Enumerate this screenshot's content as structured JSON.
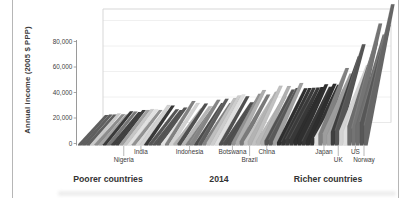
{
  "chart_data": {
    "type": "bar",
    "projection": "3d",
    "title": "",
    "ylabel": "Annual income (2005 $ PPP)",
    "xlabel": "",
    "ylim": [
      0,
      88000
    ],
    "grid": "horizontal-faint",
    "legend": "none",
    "yticks": [
      {
        "label": "0",
        "value": 0
      },
      {
        "label": "20,000",
        "value": 20000
      },
      {
        "label": "40,000",
        "value": 40000
      },
      {
        "label": "60,000",
        "value": 60000
      },
      {
        "label": "80,000",
        "value": 80000
      }
    ],
    "bottom_labels": {
      "poorer": "Poorer countries",
      "year": "2014",
      "richer": "Richer countries"
    },
    "n_bars": 70,
    "depth_dimension": "income deciles (poorest decile at front, richest at back)",
    "countries": [
      {
        "label": "Nigeria",
        "row": 2,
        "frac": 0.16,
        "poorest_decile_income": 500,
        "richest_decile_income": 9000
      },
      {
        "label": "India",
        "row": 1,
        "frac": 0.22,
        "poorest_decile_income": 800,
        "richest_decile_income": 11000
      },
      {
        "label": "Indonesia",
        "row": 1,
        "frac": 0.39,
        "poorest_decile_income": 1500,
        "richest_decile_income": 14000
      },
      {
        "label": "Botswana",
        "row": 1,
        "frac": 0.54,
        "poorest_decile_income": 1800,
        "richest_decile_income": 20000
      },
      {
        "label": "Brazil",
        "row": 2,
        "frac": 0.6,
        "poorest_decile_income": 2500,
        "richest_decile_income": 24000
      },
      {
        "label": "China",
        "row": 1,
        "frac": 0.66,
        "poorest_decile_income": 3000,
        "richest_decile_income": 26000
      },
      {
        "label": "Japan",
        "row": 1,
        "frac": 0.86,
        "poorest_decile_income": 9000,
        "richest_decile_income": 40000
      },
      {
        "label": "UK",
        "row": 2,
        "frac": 0.91,
        "poorest_decile_income": 11000,
        "richest_decile_income": 50000
      },
      {
        "label": "US",
        "row": 1,
        "frac": 0.97,
        "poorest_decile_income": 13000,
        "richest_decile_income": 72000
      },
      {
        "label": "Norway",
        "row": 2,
        "frac": 1.0,
        "poorest_decile_income": 15000,
        "richest_decile_income": 88000
      }
    ],
    "envelope_anchors": [
      {
        "frac": 0.0,
        "front": 300,
        "back": 6000
      },
      {
        "frac": 0.08,
        "front": 400,
        "back": 7500
      },
      {
        "frac": 0.16,
        "front": 500,
        "back": 9000
      },
      {
        "frac": 0.22,
        "front": 800,
        "back": 11000
      },
      {
        "frac": 0.3,
        "front": 1000,
        "back": 12500
      },
      {
        "frac": 0.39,
        "front": 1500,
        "back": 14000
      },
      {
        "frac": 0.47,
        "front": 1600,
        "back": 17000
      },
      {
        "frac": 0.54,
        "front": 1800,
        "back": 20000
      },
      {
        "frac": 0.6,
        "front": 2500,
        "back": 24000
      },
      {
        "frac": 0.66,
        "front": 3000,
        "back": 26000
      },
      {
        "frac": 0.69,
        "front": 3500,
        "back": 27000
      },
      {
        "frac": 0.82,
        "front": 5000,
        "back": 30000
      },
      {
        "frac": 0.86,
        "front": 9000,
        "back": 40000
      },
      {
        "frac": 0.91,
        "front": 11000,
        "back": 50000
      },
      {
        "frac": 0.95,
        "front": 12000,
        "back": 62000
      },
      {
        "frac": 0.97,
        "front": 13000,
        "back": 72000
      },
      {
        "frac": 1.0,
        "front": 15000,
        "back": 88000
      }
    ]
  },
  "colors": {
    "bar_dark": "#2f2f2f",
    "bar_light": "#d9d9d9",
    "axis": "#8f8f8f",
    "wall_edge": "#d2d2d2",
    "gridline": "#ececec",
    "text": "#3a3a3a",
    "panel_border": "#a9a9a9",
    "smudge": "#e9e9e9"
  }
}
